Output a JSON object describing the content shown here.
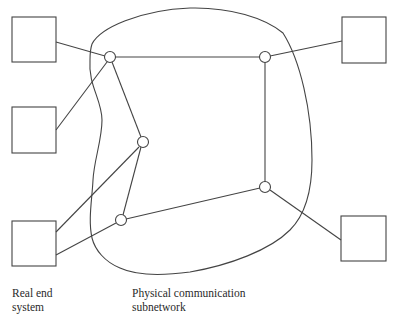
{
  "diagram": {
    "type": "network-topology",
    "colors": {
      "stroke": "#444444",
      "text": "#2a2a2a",
      "background": "#ffffff"
    },
    "labels": {
      "end_system": "Real end\nsystem",
      "subnetwork": "Physical communication\nsubnetwork"
    },
    "end_systems": [
      {
        "id": "es-top-left",
        "x": 12,
        "y": 17,
        "w": 44,
        "h": 45
      },
      {
        "id": "es-mid-left",
        "x": 12,
        "y": 107,
        "w": 44,
        "h": 46
      },
      {
        "id": "es-bottom-left",
        "x": 12,
        "y": 221,
        "w": 44,
        "h": 45
      },
      {
        "id": "es-top-right",
        "x": 342,
        "y": 17,
        "w": 44,
        "h": 46
      },
      {
        "id": "es-bottom-right",
        "x": 341,
        "y": 216,
        "w": 45,
        "h": 45
      }
    ],
    "nodes": [
      {
        "id": "n1",
        "x": 110,
        "y": 57
      },
      {
        "id": "n2",
        "x": 143,
        "y": 142
      },
      {
        "id": "n3",
        "x": 121,
        "y": 220
      },
      {
        "id": "n4",
        "x": 265,
        "y": 57
      },
      {
        "id": "n5",
        "x": 265,
        "y": 187
      }
    ]
  }
}
